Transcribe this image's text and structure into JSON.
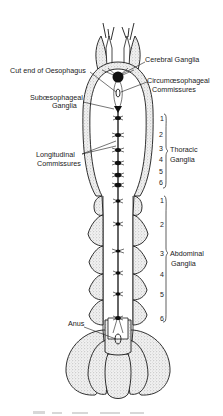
{
  "diagram": {
    "labels": {
      "cerebral_ganglia": "Cerebral Ganglia",
      "cut_end_oesophagus": "Cut end of Oesophagus",
      "circumoesophageal_line1": "Circumœsophageal",
      "circumoesophageal_line2": "Commissures",
      "suboesophageal_line1": "Subœsophageal",
      "suboesophageal_line2": "Ganglia",
      "longitudinal_line1": "Longitudinal",
      "longitudinal_line2": "Commissures",
      "thoracic_line1": "Thoracic",
      "thoracic_line2": "Ganglia",
      "abdominal_line1": "Abdominal",
      "abdominal_line2": "Ganglia",
      "anus": "Anus"
    },
    "thoracic_numbers": [
      "1",
      "2",
      "3",
      "4",
      "5",
      "6"
    ],
    "abdominal_numbers": [
      "1",
      "2",
      "3",
      "4",
      "5",
      "6"
    ],
    "colors": {
      "ink": "#1a1a1a",
      "background": "#ffffff",
      "stipple": "#bfbfbf"
    }
  }
}
